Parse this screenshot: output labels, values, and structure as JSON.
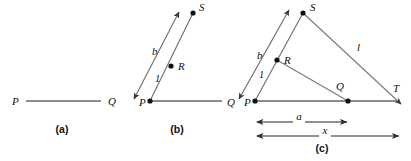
{
  "figure": {
    "background_color": "#ffffff",
    "ink_color": "#111111",
    "line_color": "#7a7a7a",
    "baseline_color": "#8d8d8d",
    "width": 411,
    "height": 161
  },
  "panels": [
    {
      "id": "a",
      "caption": "(a)",
      "caption_pos": {
        "x": 62,
        "y": 133
      },
      "points": [
        {
          "name": "P",
          "label": "P",
          "x": 22,
          "y": 101,
          "label_x": 12,
          "label_y": 105,
          "dot": false
        },
        {
          "name": "Q",
          "label": "Q",
          "x": 104,
          "y": 101,
          "label_x": 108,
          "label_y": 105,
          "dot": false
        }
      ],
      "segments": [
        {
          "name": "segment-PQ",
          "x1": 26,
          "y1": 101,
          "x2": 101,
          "y2": 101,
          "style": "seg-line"
        }
      ]
    },
    {
      "id": "b",
      "caption": "(b)",
      "caption_pos": {
        "x": 177,
        "y": 133
      },
      "points": [
        {
          "name": "P",
          "label": "P",
          "x": 150,
          "y": 101,
          "label_x": 139,
          "label_y": 106,
          "dot": true
        },
        {
          "name": "Q",
          "label": "Q",
          "x": 224,
          "y": 101,
          "label_x": 227,
          "label_y": 106,
          "dot": false
        },
        {
          "name": "R",
          "label": "R",
          "x": 171,
          "y": 66,
          "label_x": 178,
          "label_y": 70,
          "dot": true
        },
        {
          "name": "S",
          "label": "S",
          "x": 193,
          "y": 13,
          "label_x": 199,
          "label_y": 11,
          "dot": true
        }
      ],
      "segments": [
        {
          "name": "segment-PQ",
          "x1": 152,
          "y1": 101,
          "x2": 222,
          "y2": 101,
          "style": "seg-line"
        }
      ],
      "rays": [
        {
          "name": "ray-PS",
          "x1": 150,
          "y1": 101,
          "x2": 193,
          "y2": 13,
          "style": "ray-line",
          "arrow_start": false,
          "arrow_end": false
        },
        {
          "name": "parallel-line-b",
          "x1": 134,
          "y1": 99,
          "x2": 179,
          "y2": 12,
          "style": "ray-line",
          "arrow_start": true,
          "arrow_end": true
        }
      ],
      "labels": [
        {
          "name": "label-b",
          "text": "b",
          "x": 152,
          "y": 55,
          "cls": "lbl"
        },
        {
          "name": "label-1",
          "text": "1",
          "x": 155,
          "y": 82,
          "cls": "lbl-num"
        }
      ]
    },
    {
      "id": "c",
      "caption": "(c)",
      "caption_pos": {
        "x": 322,
        "y": 152
      },
      "points": [
        {
          "name": "P",
          "label": "P",
          "x": 255,
          "y": 101,
          "label_x": 244,
          "label_y": 106,
          "dot": true
        },
        {
          "name": "Q",
          "label": "Q",
          "x": 348,
          "y": 101,
          "label_x": 336,
          "label_y": 90,
          "dot": true
        },
        {
          "name": "R",
          "label": "R",
          "x": 277,
          "y": 60,
          "label_x": 284,
          "label_y": 64,
          "dot": true
        },
        {
          "name": "S",
          "label": "S",
          "x": 303,
          "y": 13,
          "label_x": 310,
          "label_y": 11,
          "dot": true
        },
        {
          "name": "T",
          "label": "T",
          "x": 400,
          "y": 101,
          "label_x": 393,
          "label_y": 92,
          "dot": false
        }
      ],
      "segments": [
        {
          "name": "segment-PT-baseline",
          "x1": 257,
          "y1": 101,
          "x2": 399,
          "y2": 101,
          "style": "seg-line"
        }
      ],
      "rays": [
        {
          "name": "ray-PS",
          "x1": 255,
          "y1": 101,
          "x2": 303,
          "y2": 13,
          "style": "ray-line",
          "arrow_start": false,
          "arrow_end": false
        },
        {
          "name": "parallel-line-b",
          "x1": 239,
          "y1": 99,
          "x2": 289,
          "y2": 10,
          "style": "ray-line",
          "arrow_start": true,
          "arrow_end": true
        },
        {
          "name": "segment-RQ",
          "x1": 277,
          "y1": 60,
          "x2": 348,
          "y2": 101,
          "style": "thin-line",
          "arrow_start": false,
          "arrow_end": false
        },
        {
          "name": "segment-ST",
          "x1": 303,
          "y1": 13,
          "x2": 401,
          "y2": 104,
          "style": "thin-line",
          "arrow_start": false,
          "arrow_end": true
        }
      ],
      "labels": [
        {
          "name": "label-b",
          "text": "b",
          "x": 257,
          "y": 59,
          "cls": "lbl"
        },
        {
          "name": "label-1",
          "text": "1",
          "x": 259,
          "y": 78,
          "cls": "lbl-num"
        },
        {
          "name": "label-l",
          "text": "l",
          "x": 357,
          "y": 51,
          "cls": "lbl"
        }
      ],
      "dimensions": [
        {
          "name": "dimension-a",
          "label": "a",
          "x1": 257,
          "x2": 347,
          "y": 122,
          "label_x": 299,
          "label_y": 120
        },
        {
          "name": "dimension-x",
          "label": "x",
          "x1": 257,
          "x2": 399,
          "y": 136,
          "label_x": 325,
          "label_y": 134
        }
      ]
    }
  ]
}
